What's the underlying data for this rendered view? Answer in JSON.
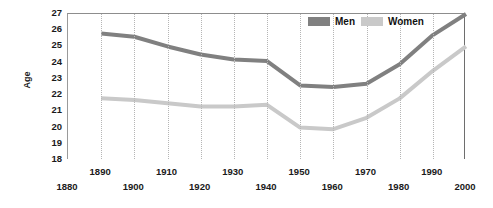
{
  "chart_data": {
    "type": "line",
    "title": "",
    "xlabel": "",
    "ylabel": "Age",
    "xlim": [
      1880,
      2000
    ],
    "ylim": [
      18,
      27
    ],
    "grid": "vertical-dotted",
    "legend_position": "top-right",
    "x": [
      1890,
      1900,
      1910,
      1920,
      1930,
      1940,
      1950,
      1960,
      1970,
      1980,
      1990,
      2000
    ],
    "xtick_labels": [
      "1880",
      "1890",
      "1900",
      "1910",
      "1920",
      "1930",
      "1940",
      "1950",
      "1960",
      "1970",
      "1980",
      "1990",
      "2000"
    ],
    "ytick_labels": [
      "27",
      "26",
      "25",
      "24",
      "23",
      "22",
      "21",
      "20",
      "19",
      "18"
    ],
    "series": [
      {
        "name": "Men",
        "color": "#808080",
        "values": [
          25.8,
          25.6,
          25.0,
          24.5,
          24.2,
          24.1,
          22.6,
          22.5,
          22.7,
          23.9,
          25.7,
          27.0
        ]
      },
      {
        "name": "Women",
        "color": "#c9c9c9",
        "values": [
          21.8,
          21.7,
          21.5,
          21.3,
          21.3,
          21.4,
          20.0,
          19.9,
          20.6,
          21.8,
          23.5,
          25.0
        ]
      }
    ]
  },
  "legend": {
    "items": [
      {
        "label": "Men",
        "color": "#808080"
      },
      {
        "label": "Women",
        "color": "#c9c9c9"
      }
    ]
  },
  "axis": {
    "y_title": "Age"
  }
}
